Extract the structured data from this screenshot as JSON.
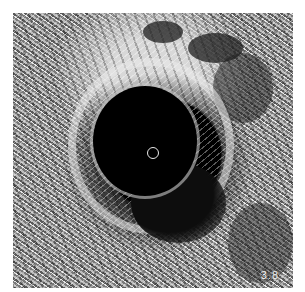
{
  "image": {
    "description": "Intravascular ultrasound (IVUS) cross-sectional grayscale image",
    "depth_label": "3.8",
    "colors": {
      "background": "#ffffff",
      "lumen": "#000000",
      "catheter_ring": "#e8e8e8",
      "label_text": "#f2f2f2"
    }
  }
}
